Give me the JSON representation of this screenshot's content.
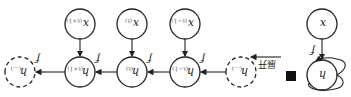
{
  "diagram": {
    "orientation": "rotated 180 degrees",
    "folded": {
      "input": {
        "label": "x"
      },
      "hidden": {
        "label": "h"
      },
      "func": "f",
      "delay": "black-square"
    },
    "unfold_label": "展开",
    "unfolded": {
      "inputs": [
        {
          "label": "x",
          "sub": "(t−1)"
        },
        {
          "label": "x",
          "sub": "(t)"
        },
        {
          "label": "x",
          "sub": "(t+1)"
        }
      ],
      "hidden": [
        {
          "label": "h",
          "sub": "(...)",
          "dashed": true
        },
        {
          "label": "h",
          "sub": "(t−1)"
        },
        {
          "label": "h",
          "sub": "(t)"
        },
        {
          "label": "h",
          "sub": "(t+1)"
        },
        {
          "label": "h",
          "sub": "(...)",
          "dashed": true
        }
      ],
      "func": "f"
    }
  }
}
